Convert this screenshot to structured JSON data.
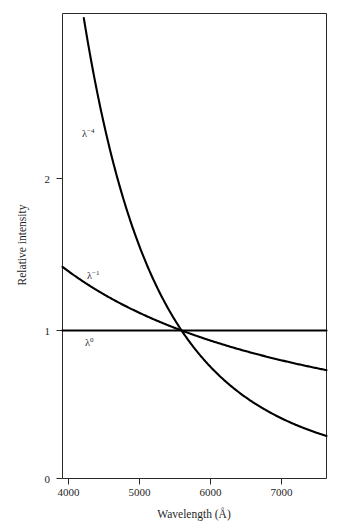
{
  "chart_data": {
    "type": "line",
    "title": "",
    "xlabel": "Wavelength (Å)",
    "ylabel": "Relative intensity",
    "xlim": [
      3915,
      7650
    ],
    "ylim": [
      0,
      3.13
    ],
    "xticks": [
      4000,
      5000,
      6000,
      7000
    ],
    "xtick_labels": [
      "4000",
      "5000",
      "6000",
      "7000"
    ],
    "yticks": [
      0,
      1,
      2
    ],
    "ytick_labels": [
      "0",
      "1",
      "2"
    ],
    "grid": false,
    "legend_position": "inline-annotations",
    "normalization_wavelength": 5600,
    "series": [
      {
        "name": "λ⁻⁴",
        "exponent": -4,
        "label_text": "λ",
        "label_exponent": "−4",
        "label_x": 4250,
        "label_y": 2.42,
        "x": [
          4200,
          4300,
          4400,
          4500,
          4600,
          4800,
          5000,
          5200,
          5400,
          5600,
          5800,
          6000,
          6200,
          6400,
          6600,
          6800,
          7000,
          7200,
          7400,
          7650
        ],
        "y": [
          3.16,
          2.87,
          2.62,
          2.4,
          2.2,
          1.85,
          1.57,
          1.35,
          1.16,
          1.0,
          0.87,
          0.76,
          0.67,
          0.59,
          0.52,
          0.46,
          0.41,
          0.37,
          0.33,
          0.29
        ]
      },
      {
        "name": "λ⁻¹",
        "exponent": -1,
        "label_text": "λ",
        "label_exponent": "−1",
        "label_x": 4290,
        "label_y": 1.32,
        "x": [
          3915,
          4200,
          4500,
          4800,
          5100,
          5400,
          5600,
          5900,
          6200,
          6500,
          6800,
          7100,
          7400,
          7650
        ],
        "y": [
          1.43,
          1.33,
          1.24,
          1.17,
          1.1,
          1.04,
          1.0,
          0.95,
          0.9,
          0.86,
          0.82,
          0.79,
          0.76,
          0.73
        ]
      },
      {
        "name": "λ⁰",
        "exponent": 0,
        "label_text": "λ",
        "label_exponent": "0",
        "label_x": 4200,
        "label_y": 0.9,
        "x": [
          3915,
          7650
        ],
        "y": [
          1.0,
          1.0
        ]
      }
    ]
  },
  "axes": {
    "x_title": "Wavelength (Å)",
    "y_title": "Relative intensity",
    "x_tick_labels": [
      "4000",
      "5000",
      "6000",
      "7000"
    ],
    "y_tick_labels": [
      "2",
      "1",
      "0"
    ]
  },
  "colors": {
    "curve": "#000000",
    "axis": "#2a2a2a",
    "text": "#1f1f1f",
    "background": "#ffffff"
  }
}
